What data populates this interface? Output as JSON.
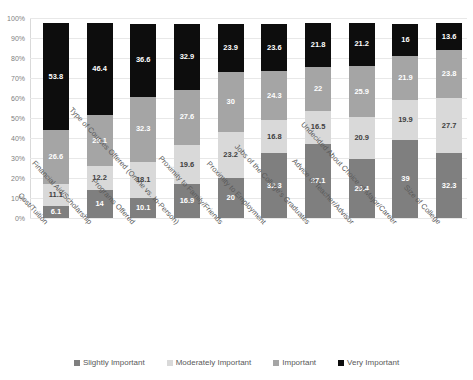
{
  "chart_data": {
    "type": "bar",
    "subtype": "stacked-percent",
    "title": "",
    "xlabel": "",
    "ylabel": "",
    "ylim": [
      0,
      100
    ],
    "grid": true,
    "legend_position": "bottom",
    "y_ticks": [
      "0%",
      "10%",
      "20%",
      "30%",
      "40%",
      "50%",
      "60%",
      "70%",
      "80%",
      "90%",
      "100%"
    ],
    "categories": [
      "Cost/Tuition",
      "Financial Aid/Scholarship",
      "Programs Offered",
      "Type of Courses Offered (Online vs. In-Person)",
      "Proximity to Family/Friends",
      "Proximity to Employment",
      "Jobs of the College's Graduates",
      "Advice of Teacher/Advisor",
      "Undecided About Choice of Major/Career",
      "Size of College"
    ],
    "series": [
      {
        "name": "Slightly Important",
        "color": "#7f7f7f",
        "values": [
          6.1,
          14,
          10.1,
          16.9,
          20,
          32.3,
          37.1,
          29.4,
          39,
          32.3
        ]
      },
      {
        "name": "Moderately Important",
        "color": "#d9d9d9",
        "values": [
          11.1,
          12.2,
          18.1,
          19.6,
          23.2,
          16.8,
          16.5,
          20.9,
          19.9,
          27.7
        ]
      },
      {
        "name": "Important",
        "color": "#a5a5a5",
        "values": [
          26.6,
          25.1,
          32.3,
          27.6,
          30,
          24.3,
          22,
          25.9,
          21.9,
          23.8
        ]
      },
      {
        "name": "Very Important",
        "color": "#0d0d0d",
        "values": [
          53.8,
          46.4,
          36.6,
          32.9,
          23.9,
          23.6,
          21.8,
          21.2,
          16,
          13.6
        ]
      }
    ]
  }
}
